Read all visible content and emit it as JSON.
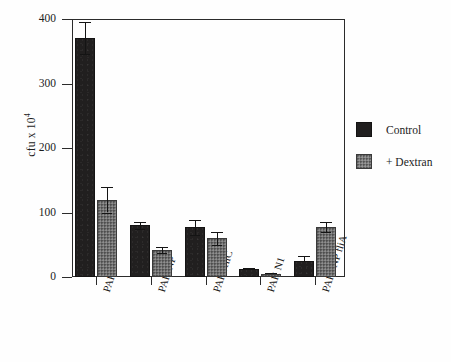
{
  "chart_data": {
    "type": "bar",
    "title": "",
    "xlabel": "",
    "ylabel": "cfu x 10",
    "ylabel_exponent": "4",
    "ylim": [
      0,
      400
    ],
    "yticks": [
      0,
      100,
      200,
      300,
      400
    ],
    "ytick_labels": [
      "0",
      "100",
      "200",
      "300",
      "400"
    ],
    "grid": false,
    "legend_position": "right",
    "categories": [
      "PAK",
      "PAK/NP",
      "PAK /fliC",
      "PAK N1",
      "PAK/ NP fliA"
    ],
    "series": [
      {
        "name": "Control",
        "color": "#211f1f",
        "values": [
          370,
          80,
          77,
          12,
          25
        ],
        "errors": [
          25,
          5,
          12,
          2,
          8
        ]
      },
      {
        "name": "+ Dextran",
        "color": "#7b7b7b",
        "values": [
          120,
          42,
          60,
          5,
          78
        ],
        "errors": [
          20,
          5,
          10,
          1,
          8
        ]
      }
    ]
  },
  "legend": {
    "items": [
      {
        "label": "Control"
      },
      {
        "label": "+ Dextran"
      }
    ]
  }
}
